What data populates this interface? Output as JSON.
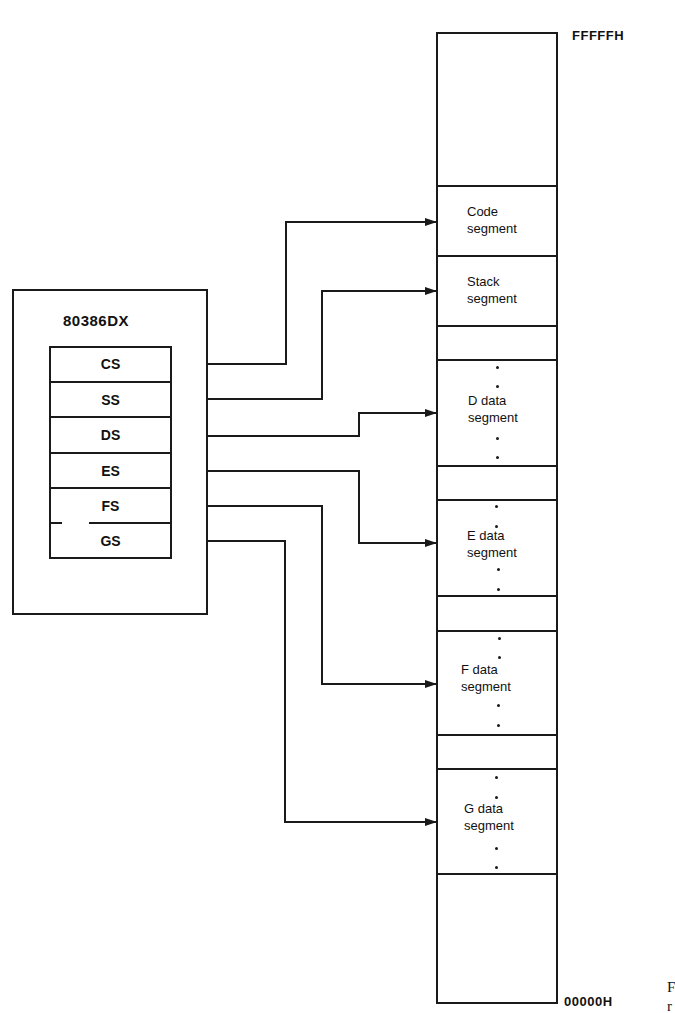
{
  "cpu": {
    "title": "80386DX",
    "registers": [
      {
        "name": "CS",
        "target": "Code segment"
      },
      {
        "name": "SS",
        "target": "Stack segment"
      },
      {
        "name": "DS",
        "target": "D data segment"
      },
      {
        "name": "ES",
        "target": "E data segment"
      },
      {
        "name": "FS",
        "target": "F data segment"
      },
      {
        "name": "GS",
        "target": "G data segment"
      }
    ]
  },
  "memory": {
    "top_address": "FFFFFH",
    "bottom_address": "00000H",
    "segments": [
      {
        "line1": "Code",
        "line2": "segment"
      },
      {
        "line1": "Stack",
        "line2": "segment"
      },
      {
        "line1": "D data",
        "line2": "segment"
      },
      {
        "line1": "E data",
        "line2": "segment"
      },
      {
        "line1": "F data",
        "line2": "segment"
      },
      {
        "line1": "G data",
        "line2": "segment"
      }
    ]
  },
  "caption_fragment": {
    "line1": "F",
    "line2": "r"
  },
  "colors": {
    "line": "#1a1a1a",
    "background": "#ffffff"
  }
}
